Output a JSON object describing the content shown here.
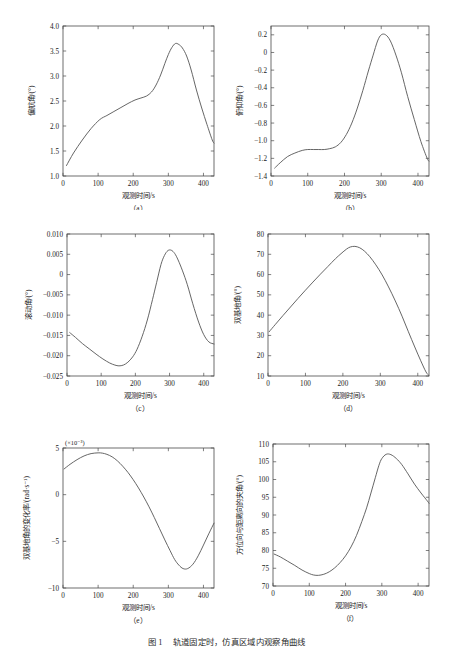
{
  "figure": {
    "caption_number": "图 1",
    "caption_text": "轨道固定时，仿真区域内观察角曲线",
    "panel_letters": [
      "（a）",
      "（b）",
      "（c）",
      "（d）",
      "（e）",
      "（f）"
    ]
  },
  "chart_data": [
    {
      "id": "a",
      "type": "line",
      "title": "",
      "xlabel": "观测时间/s",
      "ylabel": "偏航角/(°)",
      "xlim": [
        0,
        430
      ],
      "ylim": [
        1.0,
        4.0
      ],
      "xticks": [
        0,
        100,
        200,
        300,
        400
      ],
      "yticks": [
        1.0,
        1.5,
        2.0,
        2.5,
        3.0,
        3.5,
        4.0
      ],
      "xticklabels": [
        "0",
        "100",
        "200",
        "300",
        "400"
      ],
      "yticklabels": [
        "1.0",
        "1.5",
        "2.0",
        "2.5",
        "3.0",
        "3.5",
        "4.0"
      ],
      "multiplier": "",
      "grid": false,
      "legend": "none",
      "x": [
        10,
        30,
        55,
        80,
        105,
        125,
        145,
        165,
        185,
        205,
        222,
        238,
        252,
        265,
        278,
        290,
        300,
        310,
        320,
        330,
        340,
        352,
        365,
        380,
        395,
        410,
        425,
        430
      ],
      "y": [
        1.21,
        1.46,
        1.72,
        1.95,
        2.13,
        2.21,
        2.29,
        2.37,
        2.45,
        2.52,
        2.56,
        2.6,
        2.68,
        2.82,
        3.02,
        3.25,
        3.43,
        3.57,
        3.65,
        3.63,
        3.56,
        3.4,
        3.12,
        2.72,
        2.36,
        2.03,
        1.72,
        1.66
      ]
    },
    {
      "id": "b",
      "type": "line",
      "title": "",
      "xlabel": "观测时间/s",
      "ylabel": "俯仰角/(°)",
      "xlim": [
        0,
        430
      ],
      "ylim": [
        -1.4,
        0.3
      ],
      "xticks": [
        0,
        100,
        200,
        300,
        400
      ],
      "yticks": [
        -1.4,
        -1.2,
        -1.0,
        -0.8,
        -0.6,
        -0.4,
        -0.2,
        0,
        0.2
      ],
      "xticklabels": [
        "0",
        "100",
        "200",
        "300",
        "400"
      ],
      "yticklabels": [
        "-1.4",
        "-1.2",
        "-1.0",
        "-0.8",
        "-0.6",
        "-0.4",
        "-0.2",
        "0",
        "0.2"
      ],
      "multiplier": "",
      "grid": false,
      "legend": "none",
      "x": [
        10,
        25,
        45,
        65,
        85,
        100,
        115,
        130,
        145,
        160,
        175,
        190,
        205,
        220,
        235,
        250,
        265,
        278,
        290,
        300,
        312,
        325,
        340,
        355,
        372,
        390,
        408,
        425,
        430
      ],
      "y": [
        -1.31,
        -1.25,
        -1.18,
        -1.14,
        -1.11,
        -1.1,
        -1.1,
        -1.1,
        -1.1,
        -1.09,
        -1.07,
        -1.02,
        -0.93,
        -0.8,
        -0.63,
        -0.43,
        -0.21,
        -0.03,
        0.13,
        0.2,
        0.2,
        0.13,
        -0.03,
        -0.23,
        -0.5,
        -0.76,
        -1.01,
        -1.2,
        -1.23
      ]
    },
    {
      "id": "c",
      "type": "line",
      "title": "",
      "xlabel": "观测时间/s",
      "ylabel": "滚动角/(°)",
      "xlim": [
        0,
        430
      ],
      "ylim": [
        -0.025,
        0.01
      ],
      "xticks": [
        0,
        100,
        200,
        300,
        400
      ],
      "yticks": [
        -0.025,
        -0.02,
        -0.015,
        -0.01,
        -0.005,
        0,
        0.005,
        0.01
      ],
      "xticklabels": [
        "0",
        "100",
        "200",
        "300",
        "400"
      ],
      "yticklabels": [
        "-0.025",
        "-0.020",
        "-0.015",
        "-0.010",
        "-0.005",
        "0",
        "0.005",
        "0.010"
      ],
      "multiplier": "",
      "grid": false,
      "legend": "none",
      "x": [
        8,
        25,
        45,
        65,
        85,
        105,
        125,
        140,
        152,
        165,
        178,
        192,
        205,
        220,
        235,
        250,
        262,
        275,
        285,
        295,
        305,
        315,
        325,
        338,
        352,
        368,
        385,
        400,
        415,
        430
      ],
      "y": [
        -0.0143,
        -0.0155,
        -0.017,
        -0.0183,
        -0.0196,
        -0.0208,
        -0.0218,
        -0.0223,
        -0.0225,
        -0.0223,
        -0.0216,
        -0.0203,
        -0.0184,
        -0.0152,
        -0.0112,
        -0.0062,
        -0.002,
        0.0025,
        0.0047,
        0.0059,
        0.006,
        0.0052,
        0.0036,
        0.0009,
        -0.0025,
        -0.0072,
        -0.0117,
        -0.0148,
        -0.0166,
        -0.0171
      ]
    },
    {
      "id": "d",
      "type": "line",
      "title": "",
      "xlabel": "观测时间/s",
      "ylabel": "双基地角/(°)",
      "xlim": [
        0,
        430
      ],
      "ylim": [
        10,
        80
      ],
      "xticks": [
        0,
        100,
        200,
        300,
        400
      ],
      "yticks": [
        10,
        20,
        30,
        40,
        50,
        60,
        70,
        80
      ],
      "xticklabels": [
        "0",
        "100",
        "200",
        "300",
        "400"
      ],
      "yticklabels": [
        "10",
        "20",
        "30",
        "40",
        "50",
        "60",
        "70",
        "80"
      ],
      "multiplier": "",
      "grid": false,
      "legend": "none",
      "x": [
        3,
        20,
        40,
        60,
        80,
        100,
        120,
        140,
        160,
        180,
        195,
        210,
        220,
        232,
        245,
        258,
        272,
        288,
        305,
        322,
        340,
        358,
        375,
        392,
        408,
        422,
        430
      ],
      "y": [
        31.8,
        35.5,
        39.8,
        44.0,
        48.2,
        52.3,
        56.3,
        60.2,
        64.0,
        67.8,
        70.3,
        72.6,
        73.6,
        73.9,
        73.2,
        71.5,
        68.8,
        64.8,
        59.8,
        53.9,
        47.0,
        39.5,
        31.8,
        24.3,
        17.5,
        12.0,
        10.2
      ]
    },
    {
      "id": "e",
      "type": "line",
      "title": "",
      "xlabel": "观测时间/s",
      "ylabel": "双基地角的变化率/(rad·s⁻¹)",
      "xlim": [
        0,
        430
      ],
      "ylim": [
        -10,
        5
      ],
      "xticks": [
        0,
        100,
        200,
        300,
        400
      ],
      "yticks": [
        -10,
        -5,
        0,
        5
      ],
      "xticklabels": [
        "0",
        "100",
        "200",
        "300",
        "400"
      ],
      "yticklabels": [
        "-10",
        "-5",
        "0",
        "5"
      ],
      "multiplier": "(×10⁻³)",
      "grid": false,
      "legend": "none",
      "x": [
        3,
        20,
        40,
        60,
        80,
        100,
        112,
        125,
        140,
        155,
        170,
        185,
        200,
        215,
        230,
        245,
        260,
        275,
        290,
        305,
        318,
        330,
        342,
        355,
        370,
        385,
        400,
        415,
        430
      ],
      "y": [
        2.75,
        3.25,
        3.75,
        4.15,
        4.4,
        4.48,
        4.45,
        4.32,
        4.05,
        3.62,
        3.05,
        2.38,
        1.6,
        0.72,
        -0.25,
        -1.3,
        -2.45,
        -3.65,
        -4.85,
        -6.0,
        -6.95,
        -7.55,
        -7.92,
        -7.92,
        -7.45,
        -6.55,
        -5.4,
        -4.2,
        -3.05
      ]
    },
    {
      "id": "f",
      "type": "line",
      "title": "",
      "xlabel": "观测时间/s",
      "ylabel": "方位向与距离向的夹角/(°)",
      "xlim": [
        0,
        430
      ],
      "ylim": [
        70,
        110
      ],
      "xticks": [
        0,
        100,
        200,
        300,
        400
      ],
      "yticks": [
        70,
        75,
        80,
        85,
        90,
        95,
        100,
        105,
        110
      ],
      "xticklabels": [
        "0",
        "100",
        "200",
        "300",
        "400"
      ],
      "yticklabels": [
        "70",
        "75",
        "80",
        "85",
        "90",
        "95",
        "100",
        "105",
        "110"
      ],
      "multiplier": "",
      "grid": false,
      "legend": "none",
      "x": [
        3,
        20,
        40,
        60,
        80,
        100,
        112,
        125,
        140,
        155,
        170,
        185,
        200,
        215,
        230,
        245,
        258,
        270,
        282,
        292,
        300,
        312,
        325,
        340,
        355,
        372,
        390,
        408,
        425,
        430
      ],
      "y": [
        79.0,
        78.2,
        77.0,
        75.8,
        74.5,
        73.5,
        73.1,
        73.0,
        73.3,
        74.0,
        75.1,
        76.6,
        78.5,
        81.0,
        84.2,
        88.2,
        92.0,
        96.2,
        100.5,
        104.0,
        105.9,
        107.1,
        107.0,
        105.9,
        104.2,
        101.6,
        98.7,
        96.2,
        94.0,
        93.3
      ]
    }
  ]
}
